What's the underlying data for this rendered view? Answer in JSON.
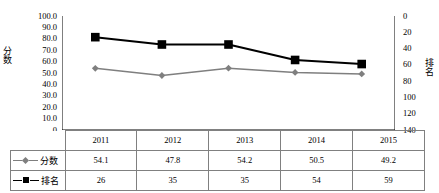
{
  "chart_data": {
    "type": "line",
    "title": "",
    "categories": [
      "2011",
      "2012",
      "2013",
      "2014",
      "2015"
    ],
    "series": [
      {
        "name": "分数",
        "axis": "left",
        "values": [
          54.1,
          47.8,
          54.2,
          50.5,
          49.2
        ],
        "color": "#7f7f7f",
        "marker": "diamond"
      },
      {
        "name": "排名",
        "axis": "right",
        "values": [
          26,
          35,
          35,
          54,
          59
        ],
        "color": "#000000",
        "marker": "square"
      }
    ],
    "xlabel": "",
    "y_left": {
      "label": "分数",
      "ticks": [
        "100.0",
        "90.0",
        "80.0",
        "70.0",
        "60.0",
        "50.0",
        "40.0",
        "30.0",
        "20.0",
        "10.0",
        "0"
      ],
      "min": 0,
      "max": 100,
      "step": 10,
      "inverted": false
    },
    "y_right": {
      "label": "排名",
      "ticks": [
        "0",
        "20",
        "40",
        "60",
        "80",
        "100",
        "120",
        "140"
      ],
      "min": 0,
      "max": 140,
      "step": 20,
      "inverted": true
    },
    "grid": false,
    "legend_position": "data-table",
    "data_table": {
      "header": [
        "",
        "2011",
        "2012",
        "2013",
        "2014",
        "2015"
      ],
      "rows": [
        {
          "key": "分数",
          "marker": "diamond",
          "color": "#7f7f7f",
          "values": [
            "54.1",
            "47.8",
            "54.2",
            "50.5",
            "49.2"
          ]
        },
        {
          "key": "排名",
          "marker": "square",
          "color": "#000000",
          "values": [
            "26",
            "35",
            "35",
            "54",
            "59"
          ]
        }
      ]
    }
  }
}
